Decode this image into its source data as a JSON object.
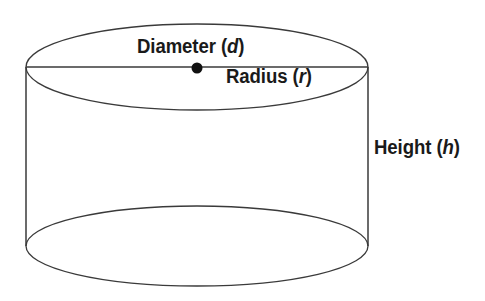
{
  "figure": {
    "background_color": "#ffffff",
    "stroke_color": "#3a3a3a",
    "text_color": "#1a1a1a",
    "labels": {
      "diameter": {
        "text": "Diameter",
        "variable": "d",
        "open_paren": "(",
        "close_paren": ")"
      },
      "radius": {
        "text": "Radius",
        "variable": "r",
        "open_paren": "(",
        "close_paren": ")"
      },
      "height": {
        "text": "Height",
        "variable": "h",
        "open_paren": "(",
        "close_paren": ")"
      }
    },
    "geometry": {
      "top_ellipse": {
        "cx": 197,
        "cy": 67,
        "rx": 171,
        "ry": 43
      },
      "bottom_ellipse": {
        "cx": 197,
        "cy": 246,
        "rx": 171,
        "ry": 40
      },
      "left_side_x": 26,
      "right_side_x": 368,
      "diameter_line_y": 67,
      "center_dot": {
        "cx": 197,
        "cy": 68,
        "r": 5.5
      }
    }
  }
}
